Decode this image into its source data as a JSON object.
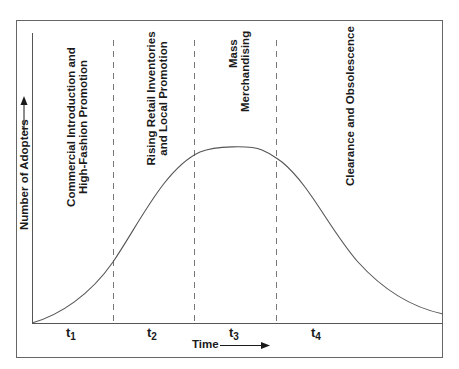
{
  "diagram": {
    "type": "fashion-life-cycle-adoption-curve",
    "x_axis": {
      "label": "Time",
      "arrow": "right-arrow"
    },
    "y_axis": {
      "label": "Number of Adopters",
      "arrow": "up-arrow"
    },
    "stages": [
      {
        "id": "t1",
        "letter": "t",
        "sub": "1",
        "lines": [
          "Commercial Introduction and",
          "High-Fashion Promotion"
        ]
      },
      {
        "id": "t2",
        "letter": "t",
        "sub": "2",
        "lines": [
          "Rising Retail Inventories",
          "and Local Promotion"
        ]
      },
      {
        "id": "t3",
        "letter": "t",
        "sub": "3",
        "lines": [
          "Mass",
          "Merchandising"
        ]
      },
      {
        "id": "t4",
        "letter": "t",
        "sub": "4",
        "lines": [
          "Clearance and Obsolescence"
        ]
      }
    ],
    "curve": {
      "shape": "bell",
      "peak_stage": "t3"
    },
    "colors": {
      "line": "#555555",
      "text": "#1a1a1a",
      "dash": "#777777",
      "frame": "#666666"
    }
  }
}
